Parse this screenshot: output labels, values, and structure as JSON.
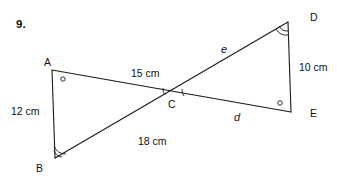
{
  "problem": {
    "number": "9."
  },
  "figure": {
    "vertices": [
      {
        "id": "A",
        "label": "A",
        "x": 52,
        "y": 70,
        "angle_mark": "circle"
      },
      {
        "id": "B",
        "label": "B",
        "x": 55,
        "y": 158,
        "angle_mark": "double-arc"
      },
      {
        "id": "C",
        "label": "C",
        "x": 174,
        "y": 95,
        "angle_mark": "double-tick"
      },
      {
        "id": "D",
        "label": "D",
        "x": 288,
        "y": 22,
        "angle_mark": "double-arc"
      },
      {
        "id": "E",
        "label": "E",
        "x": 291,
        "y": 112,
        "angle_mark": "circle"
      }
    ],
    "segments": [
      {
        "name": "AE",
        "from": "A",
        "to": "E",
        "through": "C"
      },
      {
        "name": "BD",
        "from": "B",
        "to": "D",
        "through": "C"
      },
      {
        "name": "AB",
        "from": "A",
        "to": "B"
      },
      {
        "name": "DE",
        "from": "D",
        "to": "E"
      }
    ],
    "labels": {
      "side_ac": "15 cm",
      "side_ab": "12 cm",
      "side_bc": "18 cm",
      "side_de": "10 cm",
      "side_cd": "e",
      "side_ce": "d"
    },
    "stroke_color": "#1a1a1a"
  }
}
